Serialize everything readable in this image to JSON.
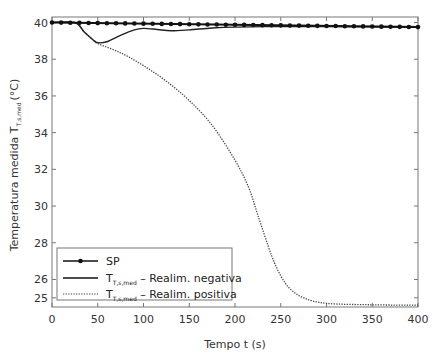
{
  "chart_data": {
    "type": "line",
    "title": "",
    "xlabel": "Tempo t (s)",
    "ylabel": "Temperatura medida T",
    "ylabel_subscript": "T,s,med",
    "ylabel_unit": "(°C)",
    "xlim": [
      0,
      400
    ],
    "ylim": [
      24.5,
      40.3
    ],
    "x_ticks": [
      0,
      50,
      100,
      150,
      200,
      250,
      300,
      350,
      400
    ],
    "y_ticks": [
      25,
      26,
      28,
      30,
      32,
      34,
      36,
      38,
      40
    ],
    "grid": false,
    "legend_position": "lower left",
    "series": [
      {
        "name": "SP",
        "style": "solid-with-dots",
        "x": [
          0,
          400
        ],
        "values": [
          40.0,
          39.75
        ]
      },
      {
        "name": "T_{T,s,med} – Realim. negativa",
        "style": "solid",
        "x": [
          0,
          25,
          35,
          45,
          50,
          60,
          75,
          90,
          100,
          115,
          130,
          150,
          175,
          200,
          250,
          300,
          350,
          400
        ],
        "values": [
          40.0,
          40.0,
          39.5,
          39.05,
          38.9,
          38.95,
          39.3,
          39.6,
          39.68,
          39.62,
          39.55,
          39.6,
          39.7,
          39.75,
          39.78,
          39.78,
          39.76,
          39.75
        ]
      },
      {
        "name": "T_{T,s,med} – Realim. positiva",
        "style": "dotted",
        "x": [
          0,
          25,
          35,
          45,
          50,
          75,
          100,
          125,
          150,
          175,
          200,
          215,
          225,
          240,
          250,
          260,
          275,
          300,
          350,
          400
        ],
        "values": [
          40.0,
          40.0,
          39.5,
          39.05,
          38.85,
          38.35,
          37.65,
          36.8,
          35.75,
          34.4,
          32.5,
          31.0,
          29.5,
          27.3,
          26.2,
          25.5,
          25.0,
          24.7,
          24.62,
          24.6
        ]
      }
    ]
  },
  "legend": {
    "items": [
      {
        "label": "SP",
        "subscript": "",
        "suffix": ""
      },
      {
        "label": "T",
        "subscript": "T,s,med",
        "suffix": " – Realim. negativa"
      },
      {
        "label": "T",
        "subscript": "T,s,med",
        "suffix": " – Realim. positiva"
      }
    ]
  }
}
